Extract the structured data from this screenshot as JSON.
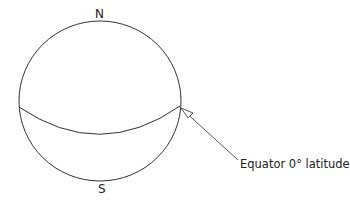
{
  "diagram": {
    "type": "sphere-with-equator",
    "labels": {
      "north": "N",
      "south": "S",
      "equator": "Equator 0° latitude"
    },
    "colors": {
      "stroke": "#333333",
      "text": "#222222",
      "background": "#ffffff"
    }
  }
}
